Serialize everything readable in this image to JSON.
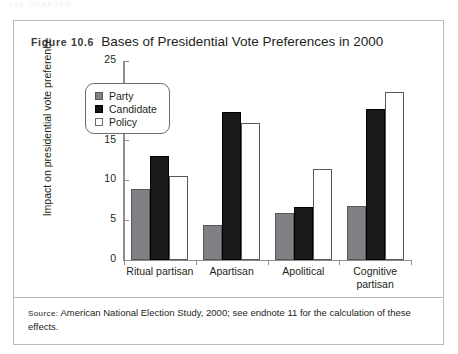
{
  "running_header": "148  CHAPTER",
  "figure": {
    "label": "Figure 10.6",
    "title": "Bases of Presidential Vote Preferences in 2000"
  },
  "source": {
    "label": "Source:",
    "text": " American National Election Study, 2000; see endnote 11 for the calculation of these effects."
  },
  "legend": {
    "items": [
      {
        "label": "Party",
        "color": "#808184"
      },
      {
        "label": "Candidate",
        "color": "#141414"
      },
      {
        "label": "Policy",
        "color": "#ffffff"
      }
    ]
  },
  "chart_data": {
    "type": "bar",
    "title": "Bases of Presidential Vote Preferences in 2000",
    "xlabel": "",
    "ylabel": "Impact on presidential vote preference",
    "categories": [
      "Ritual partisan",
      "Apartisan",
      "Apolitical",
      "Cognitive partisan"
    ],
    "category_lines": [
      [
        "Ritual partisan"
      ],
      [
        "Apartisan"
      ],
      [
        "Apolitical"
      ],
      [
        "Cognitive",
        "partisan"
      ]
    ],
    "series": [
      {
        "name": "Party",
        "color": "#808184",
        "values": [
          8.9,
          4.4,
          5.9,
          6.8
        ]
      },
      {
        "name": "Candidate",
        "color": "#141414",
        "values": [
          13.1,
          18.6,
          6.7,
          19.0
        ]
      },
      {
        "name": "Policy",
        "color": "#ffffff",
        "values": [
          10.6,
          17.2,
          11.4,
          21.1
        ]
      }
    ],
    "ylim": [
      0,
      25
    ],
    "yticks": [
      0,
      5,
      10,
      15,
      20,
      25
    ],
    "ytick_labels": [
      "0",
      "5",
      "10",
      "15",
      "20",
      "25"
    ],
    "grid": false,
    "legend_position": "upper-left-inside"
  }
}
